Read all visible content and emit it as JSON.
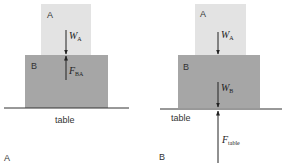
{
  "panels": [
    {
      "label": "A",
      "block_top": {
        "label": "A",
        "color": "#e3e3e3"
      },
      "block_bottom": {
        "label": "B",
        "color": "#a6a6a6"
      },
      "surface_label": "table",
      "forces": [
        {
          "symbol": "W",
          "subscript": "A",
          "direction": "down"
        },
        {
          "symbol": "F",
          "subscript": "BA",
          "direction": "up"
        }
      ]
    },
    {
      "label": "B",
      "block_top": {
        "label": "A",
        "color": "#e3e3e3"
      },
      "block_bottom": {
        "label": "B",
        "color": "#a6a6a6"
      },
      "surface_label": "table",
      "forces": [
        {
          "symbol": "W",
          "subscript": "A",
          "direction": "down"
        },
        {
          "symbol": "W",
          "subscript": "B",
          "direction": "down"
        },
        {
          "symbol": "F",
          "subscript": "table",
          "direction": "up"
        }
      ]
    }
  ],
  "colors": {
    "line": "#333333",
    "text": "#333333"
  }
}
